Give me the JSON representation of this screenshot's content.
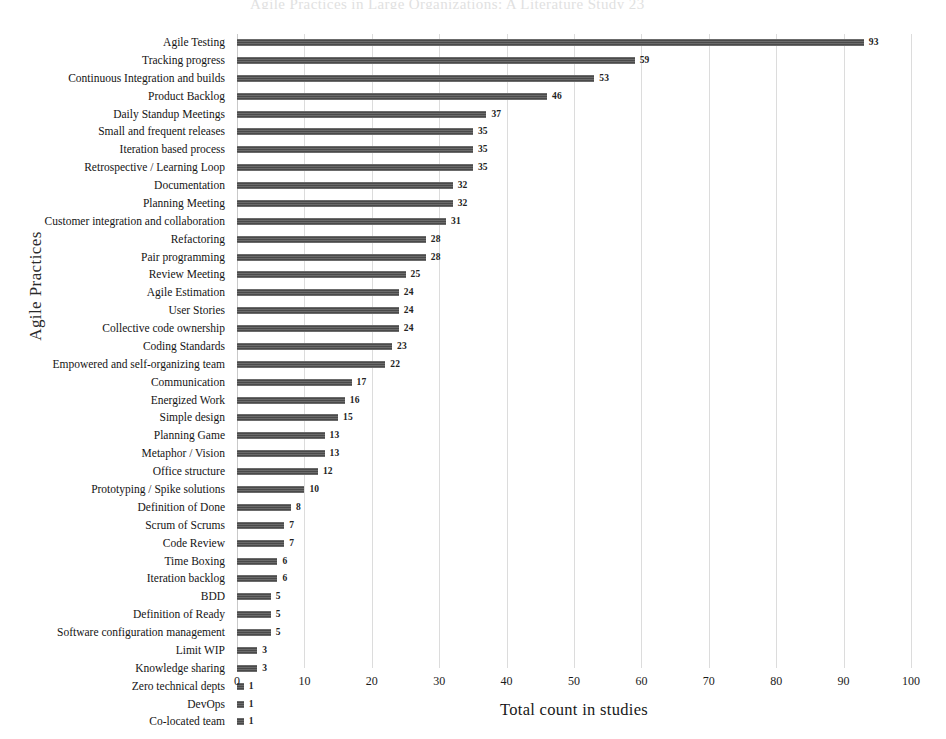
{
  "chart_data": {
    "type": "bar",
    "orientation": "horizontal",
    "title": "",
    "xlabel": "Total count in studies",
    "ylabel": "Agile Practices",
    "xlim": [
      0,
      100
    ],
    "xticks": [
      0,
      10,
      20,
      30,
      40,
      50,
      60,
      70,
      80,
      90,
      100
    ],
    "grid": true,
    "legend": null,
    "bar_color": "#4a4a4a",
    "show_value_labels": true,
    "categories": [
      "Agile Testing",
      "Tracking progress",
      "Continuous Integration and builds",
      "Product Backlog",
      "Daily Standup Meetings",
      "Small and frequent releases",
      "Iteration based process",
      "Retrospective / Learning Loop",
      "Documentation",
      "Planning Meeting",
      "Customer integration and collaboration",
      "Refactoring",
      "Pair programming",
      "Review Meeting",
      "Agile Estimation",
      "User Stories",
      "Collective code ownership",
      "Coding Standards",
      "Empowered and self-organizing team",
      "Communication",
      "Energized Work",
      "Simple design",
      "Planning Game",
      "Metaphor / Vision",
      "Office structure",
      "Prototyping / Spike solutions",
      "Definition of Done",
      "Scrum of Scrums",
      "Code Review",
      "Time Boxing",
      "Iteration backlog",
      "BDD",
      "Definition of Ready",
      "Software configuration management",
      "Limit WIP",
      "Knowledge sharing",
      "Zero technical depts",
      "DevOps",
      "Co-located team"
    ],
    "values": [
      93,
      59,
      53,
      46,
      37,
      35,
      35,
      35,
      32,
      32,
      31,
      28,
      28,
      25,
      24,
      24,
      24,
      23,
      22,
      17,
      16,
      15,
      13,
      13,
      12,
      10,
      8,
      7,
      7,
      6,
      6,
      5,
      5,
      5,
      3,
      3,
      1,
      1,
      1
    ]
  },
  "page": {
    "header_remnant": "Agile Practices in Large Organizations: A Literature Study            23"
  }
}
